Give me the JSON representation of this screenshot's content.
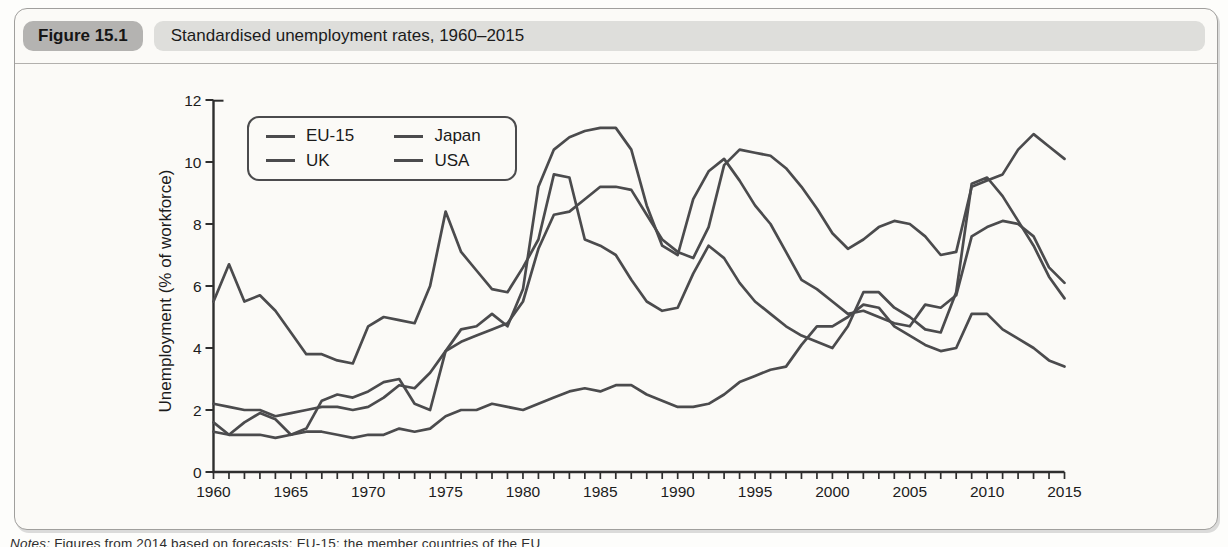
{
  "figure": {
    "label": "Figure 15.1",
    "title": "Standardised unemployment rates, 1960–2015"
  },
  "note": {
    "prefix": "Notes:",
    "text": "Figures from 2014 based on forecasts; EU-15: the member countries of the EU"
  },
  "colors": {
    "line": "#4b4b4d",
    "axis": "#2e2e2e",
    "panel_bg": "#fbfaf7",
    "badge_bg": "#b4b3b1",
    "title_pill_bg": "#dededb"
  },
  "chart_data": {
    "type": "line",
    "title": "Standardised unemployment rates, 1960–2015",
    "xlabel": "",
    "ylabel": "Unemployment (% of workforce)",
    "xlim": [
      1960,
      2015
    ],
    "ylim": [
      0,
      12
    ],
    "grid": false,
    "legend_position": "top-left-inset",
    "legend_labels": [
      "EU-15",
      "UK",
      "Japan",
      "USA"
    ],
    "x_tick_labels": [
      "1960",
      "1965",
      "1970",
      "1975",
      "1980",
      "1985",
      "1990",
      "1995",
      "2000",
      "2005",
      "2010",
      "2015"
    ],
    "y_ticks": [
      0,
      2,
      4,
      6,
      8,
      10,
      12
    ],
    "x_minor_tick_step": 1,
    "x": [
      1960,
      1961,
      1962,
      1963,
      1964,
      1965,
      1966,
      1967,
      1968,
      1969,
      1970,
      1971,
      1972,
      1973,
      1974,
      1975,
      1976,
      1977,
      1978,
      1979,
      1980,
      1981,
      1982,
      1983,
      1984,
      1985,
      1986,
      1987,
      1988,
      1989,
      1990,
      1991,
      1992,
      1993,
      1994,
      1995,
      1996,
      1997,
      1998,
      1999,
      2000,
      2001,
      2002,
      2003,
      2004,
      2005,
      2006,
      2007,
      2008,
      2009,
      2010,
      2011,
      2012,
      2013,
      2014,
      2015
    ],
    "series": [
      {
        "name": "EU-15",
        "values": [
          2.2,
          2.1,
          2.0,
          2.0,
          1.8,
          1.9,
          2.0,
          2.1,
          2.1,
          2.0,
          2.1,
          2.4,
          2.8,
          2.7,
          3.2,
          3.9,
          4.2,
          4.4,
          4.6,
          4.8,
          5.5,
          7.2,
          8.3,
          8.4,
          8.8,
          9.2,
          9.2,
          9.1,
          8.3,
          7.5,
          7.1,
          6.9,
          7.9,
          9.9,
          10.4,
          10.3,
          10.2,
          9.8,
          9.2,
          8.5,
          7.7,
          7.2,
          7.5,
          7.9,
          8.1,
          8.0,
          7.6,
          7.0,
          7.1,
          9.2,
          9.4,
          9.6,
          10.4,
          10.9,
          10.5,
          10.1
        ]
      },
      {
        "name": "UK",
        "values": [
          1.6,
          1.2,
          1.6,
          1.9,
          1.7,
          1.2,
          1.4,
          2.3,
          2.5,
          2.4,
          2.6,
          2.9,
          3.0,
          2.2,
          2.0,
          3.9,
          4.6,
          4.7,
          5.1,
          4.7,
          5.9,
          9.2,
          10.4,
          10.8,
          11.0,
          11.1,
          11.1,
          10.4,
          8.6,
          7.3,
          7.0,
          8.8,
          9.7,
          10.1,
          9.4,
          8.6,
          8.0,
          7.1,
          6.2,
          5.9,
          5.5,
          5.1,
          5.2,
          5.0,
          4.8,
          4.7,
          5.4,
          5.3,
          5.7,
          7.6,
          7.9,
          8.1,
          8.0,
          7.6,
          6.6,
          6.1
        ]
      },
      {
        "name": "Japan",
        "values": [
          1.3,
          1.2,
          1.2,
          1.2,
          1.1,
          1.2,
          1.3,
          1.3,
          1.2,
          1.1,
          1.2,
          1.2,
          1.4,
          1.3,
          1.4,
          1.8,
          2.0,
          2.0,
          2.2,
          2.1,
          2.0,
          2.2,
          2.4,
          2.6,
          2.7,
          2.6,
          2.8,
          2.8,
          2.5,
          2.3,
          2.1,
          2.1,
          2.2,
          2.5,
          2.9,
          3.1,
          3.3,
          3.4,
          4.1,
          4.7,
          4.7,
          5.0,
          5.4,
          5.3,
          4.7,
          4.4,
          4.1,
          3.9,
          4.0,
          5.1,
          5.1,
          4.6,
          4.3,
          4.0,
          3.6,
          3.4
        ]
      },
      {
        "name": "USA",
        "values": [
          5.5,
          6.7,
          5.5,
          5.7,
          5.2,
          4.5,
          3.8,
          3.8,
          3.6,
          3.5,
          4.7,
          5.0,
          4.9,
          4.8,
          6.0,
          8.4,
          7.1,
          6.5,
          5.9,
          5.8,
          6.6,
          7.5,
          9.6,
          9.5,
          7.5,
          7.3,
          7.0,
          6.2,
          5.5,
          5.2,
          5.3,
          6.4,
          7.3,
          6.9,
          6.1,
          5.5,
          5.1,
          4.7,
          4.4,
          4.2,
          4.0,
          4.7,
          5.8,
          5.8,
          5.3,
          5.0,
          4.6,
          4.5,
          5.8,
          9.3,
          9.5,
          8.9,
          8.1,
          7.3,
          6.3,
          5.6
        ]
      }
    ]
  }
}
